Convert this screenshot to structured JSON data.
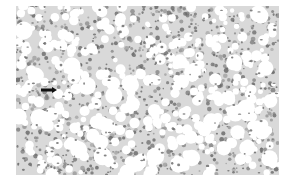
{
  "image": {
    "type": "histology-micrograph",
    "description": "Grayscale light micrograph of tissue with numerous round clear vacuoles (fat droplets) separated by strands of cells with dark nuclei",
    "stain_appearance": "grayscale",
    "colors": {
      "background": "#ffffff",
      "tissue": "#d9d9d9",
      "vacuole": "#ffffff",
      "nucleus": "#6e6e6e",
      "arrow": "#111111"
    },
    "annotations": [
      {
        "kind": "arrow",
        "direction": "right",
        "x": 41,
        "y": 90,
        "length": 15,
        "label": ""
      }
    ]
  }
}
